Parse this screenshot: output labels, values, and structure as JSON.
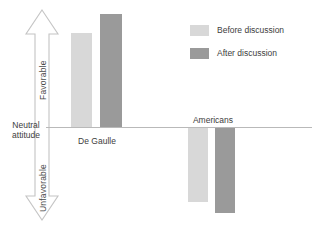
{
  "chart_data": {
    "type": "bar",
    "title": "",
    "xlabel": "",
    "ylabel": "Attitude",
    "grid": false,
    "legend_position": "top-right",
    "axis": {
      "zero_label_line1": "Neutral",
      "zero_label_line2": "attitude",
      "positive_direction_label": "Favorable",
      "negative_direction_label": "Unfavorable"
    },
    "categories": [
      "De Gaulle",
      "Americans"
    ],
    "series": [
      {
        "name": "Before discussion",
        "color": "#d8d8d8",
        "values": [
          41,
          -35
        ]
      },
      {
        "name": "After discussion",
        "color": "#9a9a9a",
        "values": [
          60,
          -46
        ]
      }
    ]
  },
  "legend": {
    "items": [
      {
        "label": "Before discussion",
        "color": "#d8d8d8"
      },
      {
        "label": "After discussion",
        "color": "#9a9a9a"
      }
    ]
  },
  "groups": [
    {
      "label": "De Gaulle",
      "label_left": 70,
      "label_top": 136,
      "label_width": 54,
      "bars": [
        {
          "name": "before",
          "left": 71,
          "top": 33,
          "width": 21,
          "height": 94
        },
        {
          "name": "after",
          "left": 100,
          "top": 14,
          "width": 22,
          "height": 113
        }
      ]
    },
    {
      "label": "Americans",
      "label_left": 186,
      "label_top": 115,
      "label_width": 54,
      "bars": [
        {
          "name": "before",
          "left": 188,
          "top": 128,
          "width": 20,
          "height": 74
        },
        {
          "name": "after",
          "left": 215,
          "top": 128,
          "width": 20,
          "height": 85
        }
      ]
    }
  ]
}
